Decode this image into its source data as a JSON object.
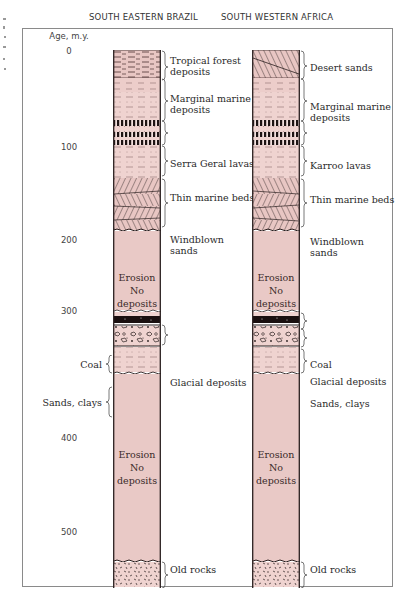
{
  "headers": {
    "left": "SOUTH EASTERN BRAZIL",
    "right": "SOUTH WESTERN AFRICA"
  },
  "axis": {
    "title": "Age, m.y.",
    "ticks": [
      "0",
      "100",
      "200",
      "300",
      "400",
      "500"
    ]
  },
  "brazil": {
    "erosion_1": [
      "Erosion",
      "No",
      "deposits"
    ],
    "erosion_2": [
      "Erosion",
      "No",
      "deposits"
    ],
    "right_labels": {
      "tropical": [
        "Tropical forest",
        "deposits"
      ],
      "marginal": [
        "Marginal marine",
        "deposits"
      ],
      "lavas": "Serra Geral lavas",
      "thin_marine": "Thin marine beds",
      "windblown": [
        "Windblown",
        "sands"
      ],
      "glacial": "Glacial deposits",
      "old_rocks": "Old rocks"
    },
    "left_labels": {
      "coal": "Coal",
      "sands_clays": "Sands, clays"
    }
  },
  "africa": {
    "erosion_1": [
      "Erosion",
      "No",
      "deposits"
    ],
    "erosion_2": [
      "Erosion",
      "No",
      "deposits"
    ],
    "right_labels": {
      "desert": "Desert sands",
      "marginal": [
        "Marginal marine",
        "deposits"
      ],
      "lavas": "Karroo lavas",
      "thin_marine": "Thin marine beds",
      "windblown": [
        "Windblown",
        "sands"
      ],
      "coal": "Coal",
      "glacial": "Glacial deposits",
      "sands_clays": "Sands, clays",
      "old_rocks": "Old rocks"
    }
  },
  "colors": {
    "column_fill": "#e9c9c6",
    "column_fill_light": "#efd5d2",
    "ink": "#2a1f1f",
    "frame": "#8a8a8a"
  }
}
